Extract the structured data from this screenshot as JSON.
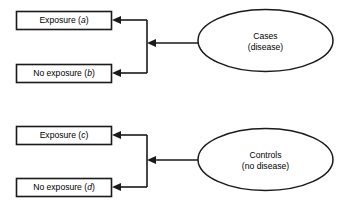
{
  "diagram": {
    "type": "case-control-flow",
    "colors": {
      "background": "#ffffff",
      "stroke": "#1a1a1a",
      "fill": "#ffffff",
      "text": "#000000"
    },
    "groups": [
      {
        "id": "cases-group",
        "source": {
          "shape": "ellipse",
          "line1": "Cases",
          "line2": "(disease)"
        },
        "outcomes": [
          {
            "id": "exposure-a",
            "prefix": "Exposure (",
            "symbol": "a",
            "suffix": ")"
          },
          {
            "id": "no-exposure-b",
            "prefix": "No exposure (",
            "symbol": "b",
            "suffix": ")"
          }
        ]
      },
      {
        "id": "controls-group",
        "source": {
          "shape": "ellipse",
          "line1": "Controls",
          "line2": "(no disease)"
        },
        "outcomes": [
          {
            "id": "exposure-c",
            "prefix": "Exposure (",
            "symbol": "c",
            "suffix": ")"
          },
          {
            "id": "no-exposure-d",
            "prefix": "No exposure (",
            "symbol": "d",
            "suffix": ")"
          }
        ]
      }
    ]
  }
}
